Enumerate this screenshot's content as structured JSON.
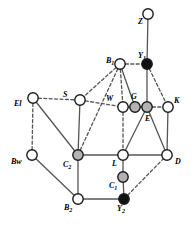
{
  "figure": {
    "width": 193,
    "height": 235,
    "background": "#ffffff"
  },
  "style": {
    "node_radius": 5.2,
    "node_stroke": "#1a1a1a",
    "node_stroke_width": 1.4,
    "fill_white": "#ffffff",
    "fill_gray": "#b3b3b3",
    "fill_black": "#111111",
    "edge_solid_color": "#555555",
    "edge_dashed_color": "#555555",
    "edge_width": 1.3,
    "dash_pattern": "3,2.4"
  },
  "nodes": [
    {
      "id": "Z",
      "label": "Z",
      "sub": "",
      "x": 148,
      "y": 14,
      "fill": "white",
      "label_dx": -10,
      "label_dy": 10
    },
    {
      "id": "B1",
      "label": "B",
      "sub": "1",
      "x": 120,
      "y": 64,
      "fill": "white",
      "label_dx": -14,
      "label_dy": -1
    },
    {
      "id": "Y1",
      "label": "Y",
      "sub": "1",
      "x": 147,
      "y": 64,
      "fill": "black",
      "label_dx": -9,
      "label_dy": -6
    },
    {
      "id": "El",
      "label": "El",
      "sub": "",
      "x": 33,
      "y": 98,
      "fill": "white",
      "label_dx": -19,
      "label_dy": 8
    },
    {
      "id": "S",
      "label": "S",
      "sub": "",
      "x": 80,
      "y": 100,
      "fill": "white",
      "label_dx": -17,
      "label_dy": -3
    },
    {
      "id": "W",
      "label": "W",
      "sub": "",
      "x": 123,
      "y": 107,
      "fill": "white",
      "label_dx": -17,
      "label_dy": -6
    },
    {
      "id": "G",
      "label": "G",
      "sub": "",
      "x": 135,
      "y": 107,
      "fill": "gray",
      "label_dx": -4,
      "label_dy": -8
    },
    {
      "id": "E",
      "label": "E",
      "sub": "",
      "x": 147,
      "y": 107,
      "fill": "gray",
      "label_dx": -2,
      "label_dy": 14
    },
    {
      "id": "K",
      "label": "K",
      "sub": "",
      "x": 168,
      "y": 107,
      "fill": "white",
      "label_dx": 6,
      "label_dy": -4
    },
    {
      "id": "Bw",
      "label": "Bw",
      "sub": "",
      "x": 32,
      "y": 155,
      "fill": "white",
      "label_dx": -21,
      "label_dy": 9
    },
    {
      "id": "C2",
      "label": "C",
      "sub": "2",
      "x": 78,
      "y": 155,
      "fill": "gray",
      "label_dx": -15,
      "label_dy": 12
    },
    {
      "id": "L",
      "label": "L",
      "sub": "",
      "x": 123,
      "y": 155,
      "fill": "white",
      "label_dx": -11,
      "label_dy": 11
    },
    {
      "id": "D",
      "label": "D",
      "sub": "",
      "x": 167,
      "y": 155,
      "fill": "white",
      "label_dx": 8,
      "label_dy": 9
    },
    {
      "id": "C1",
      "label": "C",
      "sub": "1",
      "x": 123,
      "y": 177,
      "fill": "gray",
      "label_dx": -14,
      "label_dy": 11
    },
    {
      "id": "B2",
      "label": "B",
      "sub": "2",
      "x": 78,
      "y": 199,
      "fill": "white",
      "label_dx": -14,
      "label_dy": 11
    },
    {
      "id": "Y2",
      "label": "Y",
      "sub": "2",
      "x": 124,
      "y": 199,
      "fill": "black",
      "label_dx": -7,
      "label_dy": 12
    }
  ],
  "edges": [
    {
      "from": "Z",
      "to": "Y1",
      "style": "solid"
    },
    {
      "from": "B1",
      "to": "Y1",
      "style": "dashed"
    },
    {
      "from": "B1",
      "to": "S",
      "style": "dashed"
    },
    {
      "from": "B1",
      "to": "W",
      "style": "dashed"
    },
    {
      "from": "B1",
      "to": "G",
      "style": "solid"
    },
    {
      "from": "B1",
      "to": "C2",
      "style": "dashed"
    },
    {
      "from": "Y1",
      "to": "E",
      "style": "solid"
    },
    {
      "from": "Y1",
      "to": "K",
      "style": "dashed"
    },
    {
      "from": "El",
      "to": "S",
      "style": "dashed"
    },
    {
      "from": "El",
      "to": "Bw",
      "style": "dashed"
    },
    {
      "from": "El",
      "to": "C2",
      "style": "solid"
    },
    {
      "from": "S",
      "to": "W",
      "style": "dashed"
    },
    {
      "from": "S",
      "to": "C2",
      "style": "solid"
    },
    {
      "from": "W",
      "to": "G",
      "style": "dashed"
    },
    {
      "from": "W",
      "to": "L",
      "style": "dashed"
    },
    {
      "from": "G",
      "to": "E",
      "style": "dashed"
    },
    {
      "from": "E",
      "to": "K",
      "style": "dashed"
    },
    {
      "from": "E",
      "to": "L",
      "style": "solid"
    },
    {
      "from": "E",
      "to": "D",
      "style": "solid"
    },
    {
      "from": "K",
      "to": "D",
      "style": "solid"
    },
    {
      "from": "Bw",
      "to": "B2",
      "style": "solid"
    },
    {
      "from": "C2",
      "to": "L",
      "style": "solid"
    },
    {
      "from": "C2",
      "to": "B2",
      "style": "solid"
    },
    {
      "from": "L",
      "to": "D",
      "style": "solid"
    },
    {
      "from": "L",
      "to": "C1",
      "style": "solid"
    },
    {
      "from": "C1",
      "to": "Y2",
      "style": "solid"
    },
    {
      "from": "B2",
      "to": "Y2",
      "style": "solid"
    },
    {
      "from": "Y2",
      "to": "D",
      "style": "dashed"
    }
  ]
}
